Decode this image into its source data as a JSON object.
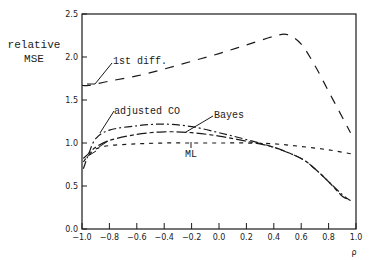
{
  "chart_data": {
    "type": "line",
    "title": "",
    "xlabel": "ρ",
    "ylabel": "relative MSE",
    "ylabel_lines": [
      "relative",
      "MSE"
    ],
    "xlim": [
      -1.0,
      1.0
    ],
    "ylim": [
      0.0,
      2.5
    ],
    "grid": false,
    "legend": "inline annotations",
    "x_ticks": [
      "-1.0",
      "-0.8",
      "-0.6",
      "-0.4",
      "-0.2",
      "0.0",
      "0.2",
      "0.4",
      "0.6",
      "0.8",
      "1.0"
    ],
    "y_ticks": [
      "0.0",
      "0.5",
      "1.0",
      "1.5",
      "2.0",
      "2.5"
    ],
    "series": [
      {
        "name": "1st diff.",
        "style": "long-dash",
        "x": [
          -1.0,
          -0.95,
          -0.8,
          -0.6,
          -0.4,
          -0.2,
          0.0,
          0.2,
          0.4,
          0.5,
          0.6,
          0.7,
          0.8,
          0.9,
          0.96
        ],
        "values": [
          1.67,
          1.67,
          1.72,
          1.78,
          1.86,
          1.95,
          2.04,
          2.14,
          2.24,
          2.26,
          2.15,
          1.9,
          1.6,
          1.3,
          1.12
        ]
      },
      {
        "name": "adjusted CO",
        "style": "dash-dot",
        "x": [
          -0.99,
          -0.95,
          -0.9,
          -0.8,
          -0.6,
          -0.4,
          -0.2,
          0.0,
          0.2,
          0.4,
          0.6,
          0.7,
          0.8,
          0.9,
          0.96
        ],
        "values": [
          0.7,
          0.88,
          1.05,
          1.15,
          1.2,
          1.22,
          1.19,
          1.12,
          1.04,
          0.95,
          0.82,
          0.7,
          0.55,
          0.4,
          0.33
        ]
      },
      {
        "name": "Bayes",
        "style": "long-short dash",
        "x": [
          -0.99,
          -0.95,
          -0.9,
          -0.8,
          -0.6,
          -0.4,
          -0.2,
          0.0,
          0.2,
          0.4,
          0.6,
          0.7,
          0.8,
          0.9,
          0.94
        ],
        "values": [
          0.82,
          0.88,
          0.95,
          1.03,
          1.1,
          1.13,
          1.12,
          1.08,
          1.02,
          0.95,
          0.82,
          0.7,
          0.55,
          0.38,
          0.35
        ]
      },
      {
        "name": "ML",
        "style": "short-dash",
        "x": [
          -0.99,
          -0.95,
          -0.9,
          -0.8,
          -0.6,
          -0.4,
          -0.2,
          0.0,
          0.2,
          0.4,
          0.6,
          0.8,
          0.98
        ],
        "values": [
          0.78,
          0.86,
          0.93,
          0.97,
          0.99,
          1.0,
          1.0,
          1.0,
          1.0,
          0.99,
          0.96,
          0.92,
          0.87
        ]
      }
    ],
    "annotations": [
      {
        "text": "1st diff.",
        "series": "1st diff."
      },
      {
        "text": "adjusted CO",
        "series": "adjusted CO"
      },
      {
        "text": "Bayes",
        "series": "Bayes"
      },
      {
        "text": "ML",
        "series": "ML"
      }
    ]
  }
}
